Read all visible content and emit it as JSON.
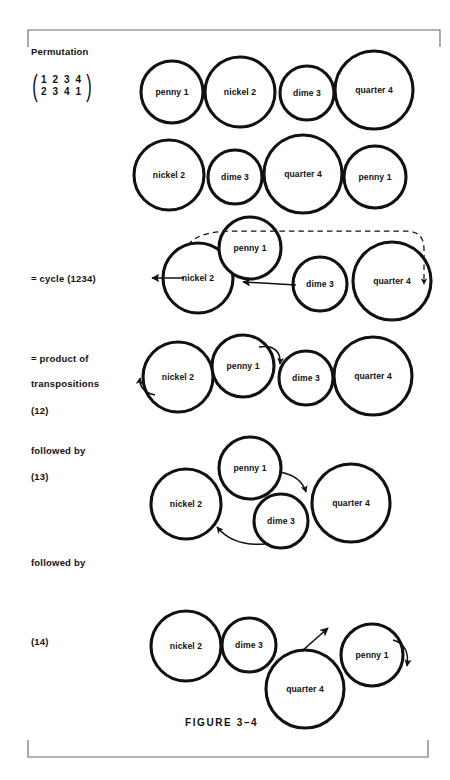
{
  "figure": {
    "caption": "FIGURE 3–4",
    "stroke_color": "#111111",
    "bracket_color": "#555555",
    "background": "#ffffff"
  },
  "labels": {
    "permutation": "Permutation",
    "matrix_top": "1 2 3 4",
    "matrix_bottom": "2 3 4 1",
    "cycle": "= cycle (1234)",
    "product_line1": "= product of",
    "product_line2": "transpositions",
    "transposition_12": "(12)",
    "followed_by_1": "followed by",
    "transposition_13": "(13)",
    "followed_by_2": "followed by",
    "transposition_14": "(14)"
  },
  "coins": {
    "penny": "penny 1",
    "nickel": "nickel 2",
    "dime": "dime 3",
    "quarter": "quarter 4"
  },
  "rows": [
    {
      "name": "row-original-order",
      "order": [
        "penny 1",
        "nickel 2",
        "dime 3",
        "quarter 4"
      ]
    },
    {
      "name": "row-permuted-order",
      "order": [
        "nickel 2",
        "dime 3",
        "quarter 4",
        "penny 1"
      ]
    },
    {
      "name": "row-cycle-1234",
      "order": [
        "nickel 2",
        "penny 1",
        "dime 3",
        "quarter 4"
      ]
    },
    {
      "name": "row-transposition-12",
      "order": [
        "nickel 2",
        "penny 1",
        "dime 3",
        "quarter 4"
      ]
    },
    {
      "name": "row-transposition-13",
      "order": [
        "nickel 2",
        "penny 1",
        "dime 3",
        "quarter 4"
      ]
    },
    {
      "name": "row-transposition-14",
      "order": [
        "nickel 2",
        "dime 3",
        "quarter 4",
        "penny 1"
      ]
    }
  ]
}
